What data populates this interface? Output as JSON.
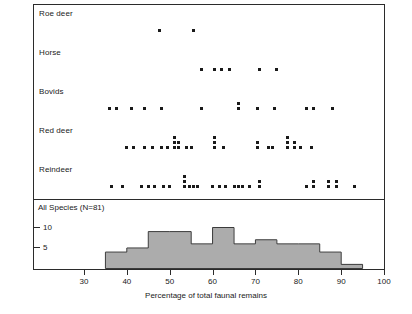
{
  "chart_data": {
    "type": "scatter",
    "title": "",
    "xlabel": "Percentage of total faunal remains",
    "ylabel": "",
    "xlim": [
      25,
      100
    ],
    "xticks": [
      30,
      40,
      50,
      60,
      70,
      80,
      90,
      100
    ],
    "xtick_labels": [
      "30",
      "40",
      "50",
      "60",
      "70",
      "80",
      "90",
      "100"
    ],
    "grid": false,
    "legend": "none",
    "panels": [
      {
        "name": "dot-plot",
        "type": "scatter",
        "note": "Stacked dot plot; one dot per site, stacked vertically where values repeat",
        "categories": [
          "Roe deer",
          "Horse",
          "Bovids",
          "Red deer",
          "Reindeer"
        ],
        "series": [
          {
            "name": "Roe deer",
            "values": [
              47.5,
              55.5
            ],
            "stacks": [
              {
                "x": 47.5,
                "count": 1
              },
              {
                "x": 55.5,
                "count": 1
              }
            ]
          },
          {
            "name": "Horse",
            "values": [
              57.5,
              60.5,
              62,
              64,
              71,
              75
            ],
            "stacks": [
              {
                "x": 57.5,
                "count": 1
              },
              {
                "x": 60.5,
                "count": 1
              },
              {
                "x": 62.0,
                "count": 1
              },
              {
                "x": 64.0,
                "count": 1
              },
              {
                "x": 71.0,
                "count": 1
              },
              {
                "x": 75.0,
                "count": 1
              }
            ]
          },
          {
            "name": "Bovids",
            "values": [
              36,
              37.5,
              41,
              44,
              48,
              57.5,
              66,
              66,
              70.5,
              74.5,
              82,
              83.5,
              88
            ],
            "stacks": [
              {
                "x": 36.0,
                "count": 1
              },
              {
                "x": 37.5,
                "count": 1
              },
              {
                "x": 41.0,
                "count": 1
              },
              {
                "x": 44.0,
                "count": 1
              },
              {
                "x": 48.0,
                "count": 1
              },
              {
                "x": 57.5,
                "count": 1
              },
              {
                "x": 66.0,
                "count": 2
              },
              {
                "x": 70.5,
                "count": 1
              },
              {
                "x": 74.5,
                "count": 1
              },
              {
                "x": 82.0,
                "count": 1
              },
              {
                "x": 83.5,
                "count": 1
              },
              {
                "x": 88.0,
                "count": 1
              }
            ]
          },
          {
            "name": "Red deer",
            "values": [
              40,
              41.5,
              44,
              46,
              48,
              49.5,
              51,
              51,
              51,
              52,
              54,
              55,
              60.5,
              60.5,
              60.5,
              62.5,
              70.5,
              70.5,
              73,
              74,
              77.5,
              77.5,
              77.5,
              79,
              79,
              80.5,
              83
            ],
            "stacks": [
              {
                "x": 40.0,
                "count": 1
              },
              {
                "x": 41.5,
                "count": 1
              },
              {
                "x": 44.0,
                "count": 1
              },
              {
                "x": 46.0,
                "count": 1
              },
              {
                "x": 48.0,
                "count": 1
              },
              {
                "x": 49.5,
                "count": 1
              },
              {
                "x": 51.0,
                "count": 3
              },
              {
                "x": 52.0,
                "count": 2
              },
              {
                "x": 54.0,
                "count": 1
              },
              {
                "x": 55.0,
                "count": 1
              },
              {
                "x": 60.5,
                "count": 3
              },
              {
                "x": 62.5,
                "count": 1
              },
              {
                "x": 70.5,
                "count": 2
              },
              {
                "x": 73.0,
                "count": 1
              },
              {
                "x": 74.0,
                "count": 1
              },
              {
                "x": 77.5,
                "count": 3
              },
              {
                "x": 79.0,
                "count": 2
              },
              {
                "x": 80.5,
                "count": 1
              },
              {
                "x": 83.0,
                "count": 1
              }
            ]
          },
          {
            "name": "Reindeer",
            "values": [
              36.5,
              39,
              43.5,
              45,
              46.5,
              48.5,
              50,
              53.5,
              53.5,
              53.5,
              54.5,
              55.5,
              56.5,
              60,
              61.5,
              63,
              65,
              66,
              67,
              68.5,
              71,
              71,
              82,
              83.5,
              83.5,
              87,
              87,
              89,
              89,
              93
            ],
            "stacks": [
              {
                "x": 36.5,
                "count": 1
              },
              {
                "x": 39.0,
                "count": 1
              },
              {
                "x": 43.5,
                "count": 1
              },
              {
                "x": 45.0,
                "count": 1
              },
              {
                "x": 46.5,
                "count": 1
              },
              {
                "x": 48.5,
                "count": 1
              },
              {
                "x": 50.0,
                "count": 1
              },
              {
                "x": 53.5,
                "count": 3
              },
              {
                "x": 54.5,
                "count": 1
              },
              {
                "x": 55.5,
                "count": 1
              },
              {
                "x": 56.5,
                "count": 1
              },
              {
                "x": 60.0,
                "count": 1
              },
              {
                "x": 61.5,
                "count": 1
              },
              {
                "x": 63.0,
                "count": 1
              },
              {
                "x": 65.0,
                "count": 1
              },
              {
                "x": 66.0,
                "count": 1
              },
              {
                "x": 67.0,
                "count": 1
              },
              {
                "x": 68.5,
                "count": 1
              },
              {
                "x": 71.0,
                "count": 2
              },
              {
                "x": 82.0,
                "count": 1
              },
              {
                "x": 83.5,
                "count": 2
              },
              {
                "x": 87.0,
                "count": 2
              },
              {
                "x": 89.0,
                "count": 2
              },
              {
                "x": 93.0,
                "count": 1
              }
            ]
          }
        ]
      },
      {
        "name": "histogram",
        "type": "bar",
        "title": "All Species (N=81)",
        "ylabel": "",
        "ylim": [
          0,
          12
        ],
        "yticks": [
          5,
          10
        ],
        "ytick_labels": [
          "5",
          "10"
        ],
        "bin_width": 5,
        "bin_starts": [
          35,
          40,
          45,
          50,
          55,
          60,
          65,
          70,
          75,
          80,
          85,
          90
        ],
        "categories": [
          "35-40",
          "40-45",
          "45-50",
          "50-55",
          "55-60",
          "60-65",
          "65-70",
          "70-75",
          "75-80",
          "80-85",
          "85-90",
          "90-95"
        ],
        "values": [
          4,
          5,
          9,
          9,
          6,
          10,
          6,
          7,
          6,
          6,
          4,
          1
        ],
        "bar_fill": "#b3b3b3",
        "bar_stroke": "#2b2b2b"
      }
    ]
  },
  "axis": {
    "xlabel": "Percentage of total faunal remains",
    "xtick_labels": [
      "30",
      "40",
      "50",
      "60",
      "70",
      "80",
      "90",
      "100"
    ]
  },
  "histogram_panel": {
    "title": "All Species (N=81)",
    "ytick_labels": [
      "5",
      "10"
    ]
  },
  "species_rows": [
    {
      "label": "Roe deer"
    },
    {
      "label": "Horse"
    },
    {
      "label": "Bovids"
    },
    {
      "label": "Red deer"
    },
    {
      "label": "Reindeer"
    }
  ],
  "colors": {
    "dot": "#1a1a1a",
    "bar_fill": "#b3b3b3",
    "bar_stroke": "#2b2b2b",
    "axis": "#2b2b2b",
    "background": "#ffffff"
  }
}
